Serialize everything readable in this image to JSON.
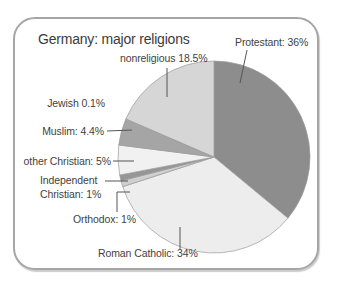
{
  "card": {
    "border_color": "#a6a6a6",
    "background": "#ffffff",
    "text_color": "#3d3d3d"
  },
  "chart_data": {
    "type": "pie",
    "title": "Germany: major religions",
    "unit": "%",
    "start_angle": "12 o'clock",
    "direction": "clockwise",
    "legend_position": "outside labels with leader lines",
    "slices": [
      {
        "name": "Protestant",
        "value": 36,
        "display_label": "Protestant: 36%",
        "color": "#8d8d8d"
      },
      {
        "name": "Roman Catholic",
        "value": 34,
        "display_label": "Roman Catholic: 34%",
        "color": "#ededed"
      },
      {
        "name": "Orthodox",
        "value": 1,
        "display_label": "Orthodox: 1%",
        "color": "#cfcfcf"
      },
      {
        "name": "Independent Christian",
        "value": 1,
        "display_label": "Independent\nChristian: 1%",
        "color": "#969696"
      },
      {
        "name": "other Christian",
        "value": 5,
        "display_label": "other Christian: 5%",
        "color": "#f1f1f1"
      },
      {
        "name": "Muslim",
        "value": 4.4,
        "display_label": "Muslim: 4.4%",
        "color": "#a5a5a5"
      },
      {
        "name": "Jewish",
        "value": 0.1,
        "display_label": "Jewish 0.1%",
        "color": "#e8e8e8"
      },
      {
        "name": "nonreligious",
        "value": 18.5,
        "display_label": "nonreligious 18.5%",
        "color": "#d6d6d6"
      }
    ],
    "outline_color": "#9b9b9b",
    "leader_line_color": "#555555"
  }
}
